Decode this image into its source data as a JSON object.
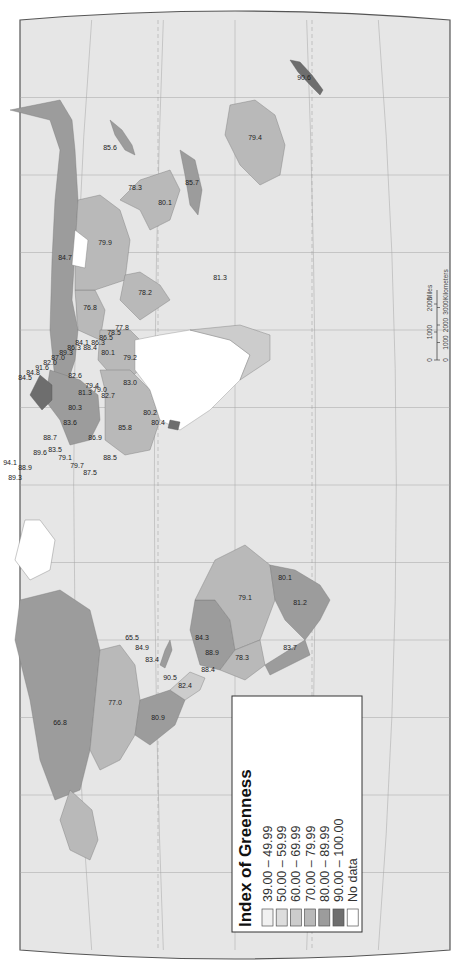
{
  "map": {
    "title": "Index of Greenness",
    "orientation": "rotated 90 degrees clockwise",
    "ocean_color": "#e6e6e6",
    "outline_color": "#555555",
    "graticule_color": "#9a9a9a"
  },
  "legend": {
    "title": "Index of Greenness",
    "classes": [
      {
        "label": "39.00 – 49.99",
        "color": "#f1f1f1"
      },
      {
        "label": "50.00 – 59.99",
        "color": "#dddddd"
      },
      {
        "label": "60.00 – 69.99",
        "color": "#cccccc"
      },
      {
        "label": "70.00 – 79.99",
        "color": "#b9b9b9"
      },
      {
        "label": "80.00 – 89.99",
        "color": "#9c9c9c"
      },
      {
        "label": "90.00 – 100.00",
        "color": "#6e6e6e"
      },
      {
        "label": "No data",
        "color": "#ffffff"
      }
    ]
  },
  "scale_bar": {
    "miles_ticks": [
      "0",
      "1000",
      "2000"
    ],
    "miles_unit": "Miles",
    "km_ticks": [
      "0",
      "1000",
      "2000",
      "3000"
    ],
    "km_unit": "Kilometers"
  },
  "regions": [
    {
      "name": "Canada",
      "value": "66.8",
      "class": 2
    },
    {
      "name": "United States",
      "value": "77.0",
      "class": 3
    },
    {
      "name": "Mexico",
      "value": "80.9",
      "class": 4
    },
    {
      "name": "Central America A",
      "value": "82.4",
      "class": 4
    },
    {
      "name": "Central America B",
      "value": "90.5",
      "class": 5
    },
    {
      "name": "Caribbean A",
      "value": "83.4",
      "class": 4
    },
    {
      "name": "Caribbean B",
      "value": "84.9",
      "class": 4
    },
    {
      "name": "Caribbean C",
      "value": "65.5",
      "class": 2
    },
    {
      "name": "Venezuela",
      "value": "84.3",
      "class": 4
    },
    {
      "name": "Colombia",
      "value": "88.9",
      "class": 4
    },
    {
      "name": "Ecuador",
      "value": "88.4",
      "class": 4
    },
    {
      "name": "Peru",
      "value": "78.3",
      "class": 3
    },
    {
      "name": "Brazil",
      "value": "79.1",
      "class": 3
    },
    {
      "name": "Uruguay",
      "value": "80.1",
      "class": 4
    },
    {
      "name": "Argentina",
      "value": "81.2",
      "class": 4
    },
    {
      "name": "Chile",
      "value": "83.7",
      "class": 4
    },
    {
      "name": "Russia",
      "value": "84.7",
      "class": 4
    },
    {
      "name": "Kazakhstan",
      "value": "76.8",
      "class": 3
    },
    {
      "name": "China",
      "value": "79.9",
      "class": 3
    },
    {
      "name": "India",
      "value": "78.2",
      "class": 3
    },
    {
      "name": "South Korea",
      "value": "78.3",
      "class": 3
    },
    {
      "name": "Japan",
      "value": "85.6",
      "class": 4
    },
    {
      "name": "Philippines",
      "value": "80.1",
      "class": 4
    },
    {
      "name": "Indonesia",
      "value": "85.7",
      "class": 4
    },
    {
      "name": "Australia",
      "value": "79.4",
      "class": 3
    },
    {
      "name": "New Zealand",
      "value": "90.6",
      "class": 5
    },
    {
      "name": "Mauritius",
      "value": "81.3",
      "class": 4
    },
    {
      "name": "Ghana",
      "value": "80.4",
      "class": 4
    },
    {
      "name": "Egypt",
      "value": "83.0",
      "class": 4
    },
    {
      "name": "Algeria",
      "value": "85.8",
      "class": 4
    },
    {
      "name": "Morocco",
      "value": "88.5",
      "class": 4
    },
    {
      "name": "Nigeria",
      "value": "80.2",
      "class": 4
    },
    {
      "name": "Saudi Arabia",
      "value": "79.2",
      "class": 3
    },
    {
      "name": "Iran",
      "value": "80.1",
      "class": 4
    },
    {
      "name": "Turkey",
      "value": "81.3",
      "class": 4
    },
    {
      "name": "Portugal",
      "value": "87.5",
      "class": 4
    },
    {
      "name": "Spain",
      "value": "79.7",
      "class": 3
    },
    {
      "name": "Italy",
      "value": "79.1",
      "class": 3
    },
    {
      "name": "Greece",
      "value": "83.5",
      "class": 4
    },
    {
      "name": "France",
      "value": "89.6",
      "class": 4
    },
    {
      "name": "United Kingdom",
      "value": "88.9",
      "class": 4
    },
    {
      "name": "Ireland",
      "value": "89.3",
      "class": 4
    },
    {
      "name": "Iceland",
      "value": "94.1",
      "class": 5
    },
    {
      "name": "Germany",
      "value": "88.7",
      "class": 4
    },
    {
      "name": "Poland",
      "value": "83.6",
      "class": 4
    },
    {
      "name": "Ukraine",
      "value": "80.3",
      "class": 4
    },
    {
      "name": "Israel",
      "value": "86.9",
      "class": 4
    },
    {
      "name": "Norway",
      "value": "84.5",
      "class": 4
    },
    {
      "name": "Sweden",
      "value": "84.8",
      "class": 4
    },
    {
      "name": "Finland",
      "value": "91.6",
      "class": 5
    },
    {
      "name": "Denmark",
      "value": "82.0",
      "class": 4
    },
    {
      "name": "Netherlands",
      "value": "87.0",
      "class": 4
    },
    {
      "name": "Belgium",
      "value": "89.3",
      "class": 4
    },
    {
      "name": "Austria",
      "value": "86.3",
      "class": 4
    },
    {
      "name": "Switzerland",
      "value": "84.1",
      "class": 4
    },
    {
      "name": "Czech Republic",
      "value": "88.4",
      "class": 4
    },
    {
      "name": "Slovakia",
      "value": "86.3",
      "class": 4
    },
    {
      "name": "Hungary",
      "value": "86.5",
      "class": 4
    },
    {
      "name": "Romania",
      "value": "78.5",
      "class": 3
    },
    {
      "name": "Bulgaria",
      "value": "77.8",
      "class": 3
    },
    {
      "name": "Belarus",
      "value": "82.6",
      "class": 4
    },
    {
      "name": "Caucasus A",
      "value": "79.4",
      "class": 3
    },
    {
      "name": "Caucasus B",
      "value": "79.0",
      "class": 3
    },
    {
      "name": "Caucasus C",
      "value": "82.7",
      "class": 4
    }
  ]
}
